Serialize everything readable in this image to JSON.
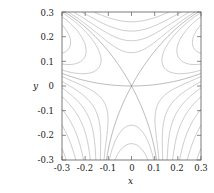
{
  "problem": {
    "number": "59."
  },
  "axes": {
    "x_label": "x",
    "y_label": "y",
    "x_ticks": [
      "-0.3",
      "-0.2",
      "-0.1",
      "0",
      "0.1",
      "0.2",
      "0.3"
    ],
    "y_ticks": [
      "0.3",
      "0.2",
      "0.1",
      "0",
      "-0.1",
      "-0.2",
      "-0.3"
    ],
    "frame_color": "#5a5a5a",
    "contour_color": "#8a8a8a"
  },
  "chart_data": {
    "type": "line",
    "plot_kind": "contour",
    "title": "",
    "xlabel": "x",
    "ylabel": "y",
    "xlim": [
      -0.3,
      0.3
    ],
    "ylim": [
      -0.3,
      0.3
    ],
    "x_tick_values": [
      -0.3,
      -0.2,
      -0.1,
      0,
      0.1,
      0.2,
      0.3
    ],
    "y_tick_values": [
      0.3,
      0.2,
      0.1,
      0,
      -0.1,
      -0.2,
      -0.3
    ],
    "grid": false,
    "legend": "none",
    "annotations": [
      {
        "text": "saddle point",
        "x": 0.0,
        "y": 0.0
      }
    ],
    "levels": [
      -0.3,
      -0.25,
      -0.2,
      -0.16,
      -0.12,
      -0.09,
      -0.06,
      -0.04,
      -0.025,
      -0.015,
      -0.008,
      -0.003,
      0.0,
      0.003,
      0.008,
      0.015,
      0.025,
      0.04,
      0.06,
      0.09,
      0.12,
      0.16,
      0.2,
      0.25,
      0.3
    ],
    "field": "z(x,y) = y*(y^2 - 3*x^2) + 1.6*(x^2 + y^2)^2 - saddle/monkey-type level set family",
    "series": [
      {
        "name": "separatrix",
        "level": 0.0,
        "closed": false
      },
      {
        "name": "upper butterfly loops",
        "level_range": [
          0.003,
          0.3
        ],
        "closed": true
      },
      {
        "name": "lower nested arcs",
        "level_range": [
          -0.3,
          -0.003
        ],
        "closed": true
      }
    ]
  }
}
